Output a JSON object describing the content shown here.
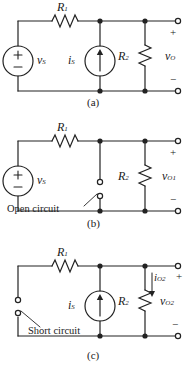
{
  "figure": {
    "line_color": "#222222",
    "bg_color": "#ffffff"
  },
  "circuits": [
    {
      "id": "a",
      "caption": "(a)",
      "labels": {
        "r1": "R",
        "r1_sub": "1",
        "vs": "v",
        "vs_sub": "S",
        "is": "i",
        "is_sub": "S",
        "r2": "R",
        "r2_sub": "2",
        "vout": "v",
        "vout_sub": "O",
        "plus": "+",
        "minus": "−",
        "src_plus": "+",
        "src_minus": "−"
      }
    },
    {
      "id": "b",
      "caption": "(b)",
      "labels": {
        "r1": "R",
        "r1_sub": "1",
        "vs": "v",
        "vs_sub": "S",
        "r2": "R",
        "r2_sub": "2",
        "vout": "v",
        "vout_sub": "O1",
        "plus": "+",
        "minus": "−",
        "src_plus": "+",
        "src_minus": "−",
        "annotation": "Open circuit"
      }
    },
    {
      "id": "c",
      "caption": "(c)",
      "labels": {
        "r1": "R",
        "r1_sub": "1",
        "is": "i",
        "is_sub": "S",
        "r2": "R",
        "r2_sub": "2",
        "iout": "i",
        "iout_sub": "O2",
        "vout": "v",
        "vout_sub": "O2",
        "plus": "+",
        "minus": "−",
        "annotation": "Short circuit"
      }
    }
  ]
}
